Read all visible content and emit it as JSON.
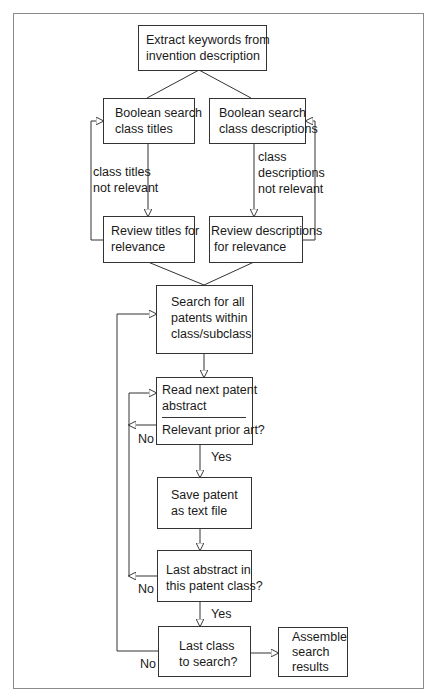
{
  "diagram": {
    "type": "flowchart",
    "nodes": {
      "extract": {
        "lines": [
          "Extract keywords from",
          "invention description"
        ]
      },
      "bool_titles": {
        "lines": [
          "Boolean search",
          "class titles"
        ]
      },
      "bool_desc": {
        "lines": [
          "Boolean search",
          "class descriptions"
        ]
      },
      "review_titles": {
        "lines": [
          "Review titles for",
          "relevance"
        ]
      },
      "review_desc": {
        "lines": [
          "Review descriptions",
          "for relevance"
        ]
      },
      "search_all": {
        "lines": [
          "Search for all",
          "patents within",
          "class/subclass"
        ]
      },
      "read_abstract": {
        "lines": [
          "Read next patent",
          "abstract"
        ],
        "question": "Relevant prior art?"
      },
      "save_patent": {
        "lines": [
          "Save patent",
          "as text file"
        ]
      },
      "last_abstract": {
        "lines": [
          "Last abstract in",
          "this patent class?"
        ]
      },
      "last_class": {
        "lines": [
          "Last class",
          "to search?"
        ]
      },
      "assemble": {
        "lines": [
          "Assemble",
          "search",
          "results"
        ]
      }
    },
    "edge_labels": {
      "titles_not_relevant": [
        "class titles",
        "not relevant"
      ],
      "desc_not_relevant": [
        "class",
        "descriptions",
        "not relevant"
      ],
      "relevant_no": "No",
      "relevant_yes": "Yes",
      "last_abstract_no": "No",
      "last_abstract_yes": "Yes",
      "last_class_no": "No"
    }
  }
}
